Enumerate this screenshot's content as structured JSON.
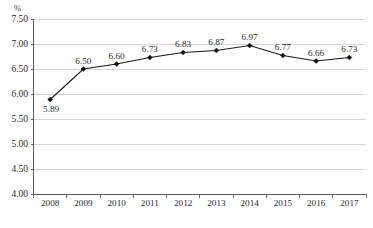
{
  "chart_data": {
    "type": "line",
    "title": "",
    "xlabel": "",
    "ylabel": "",
    "unit_label": "%",
    "categories": [
      "2008",
      "2009",
      "2010",
      "2011",
      "2012",
      "2013",
      "2014",
      "2015",
      "2016",
      "2017"
    ],
    "values": [
      5.89,
      6.5,
      6.6,
      6.73,
      6.83,
      6.87,
      6.97,
      6.77,
      6.66,
      6.73
    ],
    "point_labels": [
      "5.89",
      "6.50",
      "6.60",
      "6.73",
      "6.83",
      "6.87",
      "6.97",
      "6.77",
      "6.66",
      "6.73"
    ],
    "ylim": [
      4.0,
      7.5
    ],
    "ytick_labels": [
      "7.50",
      "7.00",
      "6.50",
      "6.00",
      "5.50",
      "5.00",
      "4.50",
      "4.00"
    ],
    "ytick_values": [
      7.5,
      7.0,
      6.5,
      6.0,
      5.5,
      5.0,
      4.5,
      4.0
    ],
    "grid": true,
    "legend": "none",
    "marker_shape": "diamond",
    "series_color": "#1a1a1a",
    "grid_color": "#b9b9b9",
    "axis_color": "#4a4a4a"
  },
  "caption": {
    "text": ""
  }
}
